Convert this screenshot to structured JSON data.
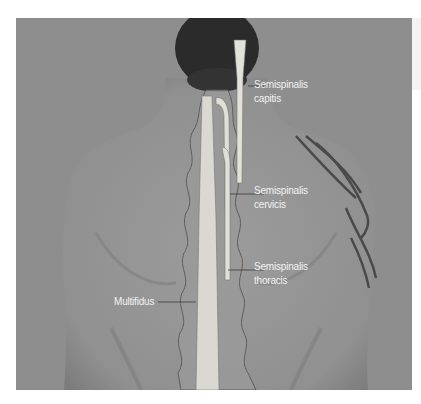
{
  "figure": {
    "colors": {
      "background": "#8e8e8e",
      "skin": "#959595",
      "hair": "#2a2a2a",
      "muscle": "#dcdcd4",
      "vertebra_outline": "#5a5a5a",
      "label_text": "#f2f2f2",
      "leader_line": "#3a3a3a"
    }
  },
  "labels": {
    "semispinalis_capitis": {
      "line1": "Semispinalis",
      "line2": "capitis"
    },
    "semispinalis_cervicis": {
      "line1": "Semispinalis",
      "line2": "cervicis"
    },
    "semispinalis_thoracis": {
      "line1": "Semispinalis",
      "line2": "thoracis"
    },
    "multifidus": {
      "line1": "Multifidus"
    }
  }
}
